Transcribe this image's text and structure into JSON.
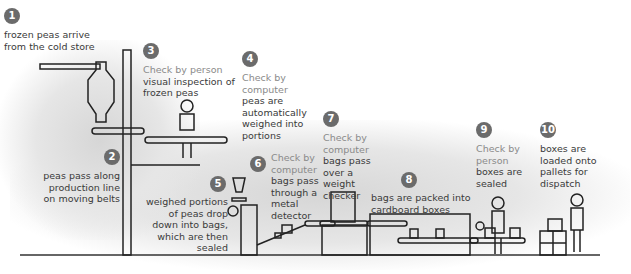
{
  "colors": {
    "step_circle": "#6b6b6b",
    "check_text": "#8a8a8a",
    "body_text": "#3a3a3a",
    "shading": "#d6d6d6"
  },
  "steps": [
    {
      "number": "1",
      "check": "",
      "text": "frozen peas arrive from the cold store"
    },
    {
      "number": "2",
      "check": "",
      "text": "peas pass along production line on moving belts"
    },
    {
      "number": "3",
      "check": "Check by person",
      "text": "visual inspection of frozen peas"
    },
    {
      "number": "4",
      "check": "Check by computer",
      "text": "peas are automatically weighed into portions"
    },
    {
      "number": "5",
      "check": "",
      "text": "weighed portions of peas drop down into bags, which are then sealed"
    },
    {
      "number": "6",
      "check": "Check by computer",
      "text": "bags pass through a metal detector"
    },
    {
      "number": "7",
      "check": "Check by computer",
      "text": "bags pass over a weight checker"
    },
    {
      "number": "8",
      "check": "",
      "text": "bags are packed into cardboard boxes"
    },
    {
      "number": "9",
      "check": "Check by person",
      "text": "boxes are sealed"
    },
    {
      "number": "10",
      "check": "",
      "text": "boxes are loaded onto pallets for dispatch"
    }
  ]
}
